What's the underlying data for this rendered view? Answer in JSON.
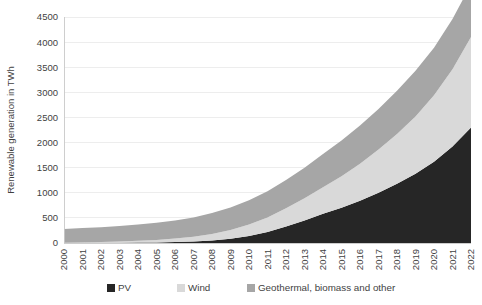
{
  "chart_data": {
    "type": "area",
    "stacked": true,
    "title": "",
    "xlabel": "",
    "ylabel": "Renewable generation in TWh",
    "ylim": [
      0,
      4500
    ],
    "ytick_step": 500,
    "yticks": [
      0,
      500,
      1000,
      1500,
      2000,
      2500,
      3000,
      3500,
      4000,
      4500
    ],
    "grid": true,
    "legend_position": "bottom",
    "categories": [
      "2000",
      "2001",
      "2002",
      "2003",
      "2004",
      "2005",
      "2006",
      "2007",
      "2008",
      "2009",
      "2010",
      "2011",
      "2012",
      "2013",
      "2014",
      "2015",
      "2016",
      "2017",
      "2018",
      "2019",
      "2020",
      "2021",
      "2022"
    ],
    "series": [
      {
        "name": "PV",
        "color": "#262626",
        "values": [
          1,
          2,
          3,
          5,
          8,
          12,
          19,
          30,
          50,
          85,
          140,
          220,
          330,
          450,
          580,
          700,
          840,
          1000,
          1180,
          1380,
          1620,
          1920,
          2300
        ]
      },
      {
        "name": "Wind",
        "color": "#d9d9d9",
        "values": [
          5,
          10,
          17,
          25,
          35,
          50,
          70,
          95,
          130,
          175,
          230,
          290,
          360,
          440,
          530,
          630,
          740,
          860,
          990,
          1140,
          1320,
          1540,
          1800
        ]
      },
      {
        "name": "Geothermal, biomass and other",
        "color": "#a6a6a6",
        "values": [
          275,
          285,
          295,
          310,
          325,
          340,
          360,
          385,
          415,
          445,
          480,
          520,
          565,
          610,
          660,
          710,
          760,
          810,
          860,
          910,
          950,
          1000,
          1050
        ]
      }
    ],
    "stack_order": [
      "PV",
      "Wind",
      "Geothermal, biomass and other"
    ],
    "totals": [
      281,
      297,
      315,
      340,
      368,
      402,
      449,
      510,
      595,
      705,
      850,
      1030,
      1255,
      1500,
      1770,
      2040,
      2340,
      2670,
      3030,
      3430,
      3890,
      4460,
      5150
    ]
  },
  "legend": {
    "items": [
      {
        "label": "PV",
        "color": "#262626"
      },
      {
        "label": "Wind",
        "color": "#d9d9d9"
      },
      {
        "label": "Geothermal, biomass and other",
        "color": "#a6a6a6"
      }
    ]
  },
  "axes": {
    "y_title": "Renewable generation in TWh"
  }
}
